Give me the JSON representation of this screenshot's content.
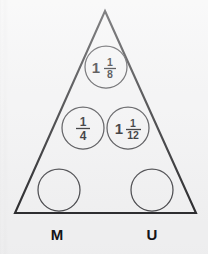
{
  "figure": {
    "type": "triangle-fraction-puzzle",
    "background_color": "#f4f4f5",
    "outline_color": "#1d1d20",
    "circle_stroke_color": "#3a3a3e",
    "text_color": "#111114",
    "triangle": {
      "apex": {
        "x": 105,
        "y": 11
      },
      "bottom_left": {
        "x": 15,
        "y": 213
      },
      "bottom_right": {
        "x": 196,
        "y": 213
      }
    },
    "cells": [
      {
        "id": "top-cell",
        "name": "circle-top",
        "cx": 106,
        "cy": 67,
        "r": 21,
        "empty": false,
        "whole": "1",
        "numerator": "1",
        "denominator": "8",
        "value_text": "1 1/8"
      },
      {
        "id": "middle-left-cell",
        "name": "circle-middle-left",
        "cx": 83,
        "cy": 128,
        "r": 21,
        "empty": false,
        "whole": "",
        "numerator": "1",
        "denominator": "4",
        "value_text": "1/4"
      },
      {
        "id": "middle-right-cell",
        "name": "circle-middle-right",
        "cx": 128,
        "cy": 128,
        "r": 21,
        "empty": false,
        "whole": "1",
        "numerator": "1",
        "denominator": "12",
        "value_text": "1 1/12"
      },
      {
        "id": "bottom-left-cell",
        "name": "circle-bottom-left",
        "cx": 59,
        "cy": 190,
        "r": 21,
        "empty": true,
        "whole": "",
        "numerator": "",
        "denominator": "",
        "value_text": ""
      },
      {
        "id": "bottom-right-cell",
        "name": "circle-bottom-right",
        "cx": 152,
        "cy": 190,
        "r": 21,
        "empty": true,
        "whole": "",
        "numerator": "",
        "denominator": "",
        "value_text": ""
      }
    ],
    "corner_labels": [
      {
        "id": "label-m",
        "text": "M",
        "x": 57,
        "y": 240
      },
      {
        "id": "label-u",
        "text": "U",
        "x": 152,
        "y": 240
      }
    ]
  }
}
